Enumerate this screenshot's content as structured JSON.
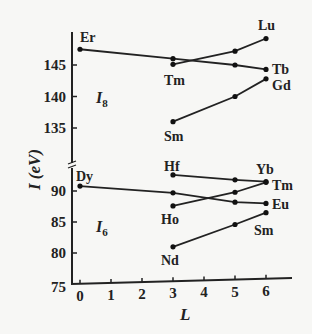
{
  "chart_data": {
    "type": "line",
    "title": "",
    "xlabel": "L",
    "ylabel": "I (eV)",
    "x_ticks": [
      0,
      1,
      2,
      3,
      4,
      5,
      6
    ],
    "y_ticks_upper": [
      135,
      140,
      145
    ],
    "y_ticks_lower": [
      75,
      80,
      85,
      90
    ],
    "axis_break": true,
    "grid": false,
    "panels": [
      {
        "name": "I8",
        "label_main": "I",
        "label_sub": "8",
        "series": [
          {
            "name": "Er-Tb",
            "points": [
              {
                "x": 0,
                "y": 147.5,
                "label": "Er"
              },
              {
                "x": 3,
                "y": 146.0
              },
              {
                "x": 5,
                "y": 145.0
              },
              {
                "x": 6,
                "y": 144.3,
                "label": "Tb"
              }
            ]
          },
          {
            "name": "Tm-Lu",
            "points": [
              {
                "x": 3,
                "y": 145.1,
                "label": "Tm"
              },
              {
                "x": 5,
                "y": 147.2
              },
              {
                "x": 6,
                "y": 149.2,
                "label": "Lu"
              }
            ]
          },
          {
            "name": "Sm-Gd",
            "points": [
              {
                "x": 3,
                "y": 136.0,
                "label": "Sm"
              },
              {
                "x": 5,
                "y": 140.0
              },
              {
                "x": 6,
                "y": 142.8,
                "label": "Gd"
              }
            ]
          }
        ]
      },
      {
        "name": "I6",
        "label_main": "I",
        "label_sub": "6",
        "series": [
          {
            "name": "Dy-Eu",
            "points": [
              {
                "x": 0,
                "y": 90.8,
                "label": "Dy"
              },
              {
                "x": 3,
                "y": 89.7
              },
              {
                "x": 5,
                "y": 88.2
              },
              {
                "x": 6,
                "y": 88.0,
                "label": "Eu"
              }
            ]
          },
          {
            "name": "Hf-Yb",
            "points": [
              {
                "x": 3,
                "y": 92.6,
                "label": "Hf"
              },
              {
                "x": 5,
                "y": 91.8
              },
              {
                "x": 6,
                "y": 91.5,
                "label": "Yb"
              }
            ]
          },
          {
            "name": "Ho-Tm",
            "points": [
              {
                "x": 3,
                "y": 87.6,
                "label": "Ho"
              },
              {
                "x": 5,
                "y": 89.8
              },
              {
                "x": 6,
                "y": 91.4,
                "label": "Tm"
              }
            ]
          },
          {
            "name": "Nd-Sm",
            "points": [
              {
                "x": 3,
                "y": 81.0,
                "label": "Nd"
              },
              {
                "x": 5,
                "y": 84.6
              },
              {
                "x": 6,
                "y": 86.5,
                "label": "Sm"
              }
            ]
          }
        ]
      }
    ]
  },
  "labels": {
    "upper": [
      {
        "text": "Er",
        "x": 80,
        "y": 42
      },
      {
        "text": "Lu",
        "x": 258,
        "y": 30
      },
      {
        "text": "Tm",
        "x": 164,
        "y": 85
      },
      {
        "text": "Tb",
        "x": 272,
        "y": 74
      },
      {
        "text": "Gd",
        "x": 272,
        "y": 90
      },
      {
        "text": "Sm",
        "x": 164,
        "y": 141
      }
    ],
    "lower": [
      {
        "text": "Dy",
        "x": 76,
        "y": 181
      },
      {
        "text": "Hf",
        "x": 164,
        "y": 171
      },
      {
        "text": "Yb",
        "x": 256,
        "y": 174
      },
      {
        "text": "Tm",
        "x": 272,
        "y": 190
      },
      {
        "text": "Eu",
        "x": 272,
        "y": 209
      },
      {
        "text": "Ho",
        "x": 161,
        "y": 224
      },
      {
        "text": "Sm",
        "x": 254,
        "y": 235
      },
      {
        "text": "Nd",
        "x": 161,
        "y": 265
      }
    ]
  }
}
